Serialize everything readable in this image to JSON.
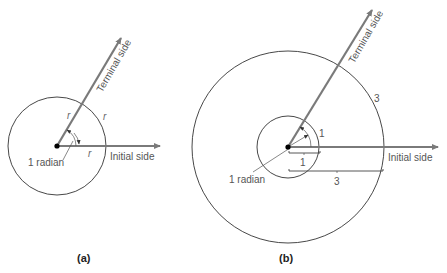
{
  "figure": {
    "panel_a": {
      "caption": "(a)",
      "terminal_label": "Terminal side",
      "initial_label": "Initial side",
      "angle_label": "1 radian",
      "radius_labels": [
        "r",
        "r",
        "r"
      ]
    },
    "panel_b": {
      "caption": "(b)",
      "terminal_label": "Terminal side",
      "initial_label": "Initial side",
      "angle_label": "1 radian",
      "small_arc_label": "1",
      "small_radius_label": "1",
      "big_arc_label": "3",
      "big_radius_label": "3"
    },
    "colors": {
      "ray": "#7a7a7a",
      "circle": "#333333",
      "text": "#555555"
    }
  }
}
